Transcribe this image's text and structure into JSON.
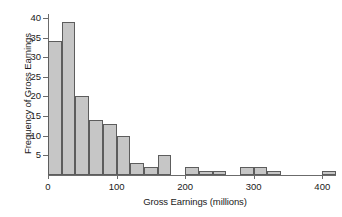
{
  "chart_data": {
    "type": "bar",
    "title": "",
    "xlabel": "Gross Earnings (millions)",
    "ylabel": "Frequency of Gross Earnings",
    "xlim": [
      0,
      420
    ],
    "ylim": [
      0,
      41
    ],
    "grid": false,
    "legend": null,
    "bin_width": 20,
    "xticks": [
      0,
      100,
      200,
      300,
      400
    ],
    "xtick_labels": [
      "0",
      "100",
      "200",
      "300",
      "400"
    ],
    "yticks": [
      5,
      10,
      15,
      20,
      25,
      30,
      35,
      40
    ],
    "ytick_labels": [
      "5",
      "10",
      "15",
      "20",
      "25",
      "30",
      "35",
      "40"
    ],
    "categories": [
      "0-20",
      "20-40",
      "40-60",
      "60-80",
      "80-100",
      "100-120",
      "120-140",
      "140-160",
      "160-180",
      "180-200",
      "200-220",
      "220-240",
      "240-260",
      "260-280",
      "280-300",
      "300-320",
      "320-340",
      "340-360",
      "360-380",
      "380-400",
      "400-420"
    ],
    "bin_starts": [
      0,
      20,
      40,
      60,
      80,
      100,
      120,
      140,
      160,
      180,
      200,
      220,
      240,
      260,
      280,
      300,
      320,
      340,
      360,
      380,
      400
    ],
    "values": [
      34,
      39,
      20,
      14,
      13,
      10,
      3,
      2,
      5,
      0,
      2,
      1,
      1,
      0,
      2,
      2,
      1,
      0,
      0,
      0,
      1
    ],
    "bar_fill_color": "#c6c6c6",
    "bar_edge_color": "#5d5d5d",
    "axis_color": "#6b6b6b",
    "background_color": "#ffffff"
  }
}
